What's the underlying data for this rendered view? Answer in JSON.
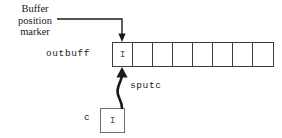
{
  "diagram": {
    "title_label": "Buffer\nposition\nmarker",
    "buffer_name": "outbuff",
    "operation_label": "sputc",
    "source_var_label": "c",
    "source_var_value": "I",
    "buffer_cells": [
      "I",
      "",
      "",
      "",
      "",
      "",
      "",
      ""
    ],
    "cell_count": 8,
    "colors": {
      "background": "#ffffff",
      "stroke": "#3c3c3c",
      "arrow": "#1a1a1a",
      "text": "#1a1a1a",
      "glyph": "#555555"
    }
  }
}
